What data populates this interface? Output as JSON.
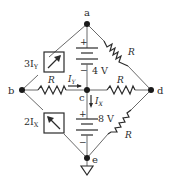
{
  "diagram": {
    "type": "circuit",
    "nodes": {
      "a": {
        "label": "a"
      },
      "b": {
        "label": "b"
      },
      "c": {
        "label": "c"
      },
      "d": {
        "label": "d"
      },
      "e": {
        "label": "e"
      }
    },
    "components": {
      "src_top": {
        "label": "3I",
        "sub": "Y",
        "kind": "dependent-current-source",
        "between": "a-b"
      },
      "src_bottom": {
        "label": "2I",
        "sub": "X",
        "kind": "dependent-current-source",
        "between": "b-e"
      },
      "bat_top": {
        "label": "4 V",
        "plus": "+",
        "minus": "−",
        "between": "a-c"
      },
      "bat_bottom": {
        "label": "8 V",
        "plus": "+",
        "minus": "−",
        "between": "c-e"
      },
      "r_ad": {
        "label": "R",
        "between": "a-d"
      },
      "r_bc": {
        "label": "R",
        "between": "b-c"
      },
      "r_cd": {
        "label": "R",
        "between": "c-d"
      },
      "r_de": {
        "label": "R",
        "between": "d-e"
      }
    },
    "currents": {
      "iy": {
        "label": "I",
        "sub": "Y"
      },
      "ix": {
        "label": "I",
        "sub": "X"
      }
    },
    "ground": {
      "at": "e"
    },
    "colors": {
      "wire": "#6a6a6a",
      "ink": "#2b2b2b"
    }
  }
}
